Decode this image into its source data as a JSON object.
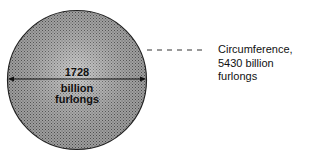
{
  "diagram": {
    "diameter": {
      "value": "1728",
      "unit_line1": "billion",
      "unit_line2": "furlongs"
    },
    "circumference": {
      "line1": "Circumference,",
      "line2": "5430 billion furlongs"
    },
    "colors": {
      "fill": "#9a9a9a",
      "stroke": "#222222",
      "text": "#111111"
    }
  }
}
